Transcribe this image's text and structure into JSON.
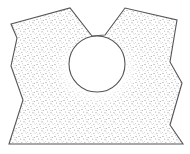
{
  "diagram": {
    "colors": {
      "background": "#ffffff",
      "outline": "#555555",
      "stipple": "#8a8a8a",
      "halo": "#ffffff"
    },
    "polygon_points": [
      [
        11,
        24
      ],
      [
        70,
        8
      ],
      [
        92,
        36
      ],
      [
        105,
        35
      ],
      [
        125,
        8
      ],
      [
        177,
        20
      ],
      [
        170,
        62
      ],
      [
        182,
        83
      ],
      [
        170,
        125
      ],
      [
        183,
        144
      ],
      [
        9,
        144
      ],
      [
        23,
        100
      ],
      [
        11,
        66
      ],
      [
        17,
        38
      ]
    ],
    "opening": {
      "cx": 97,
      "cy": 64,
      "r": 28
    },
    "halo": {
      "cx": 97,
      "cy": 70,
      "rx": 44,
      "ry": 36
    }
  }
}
